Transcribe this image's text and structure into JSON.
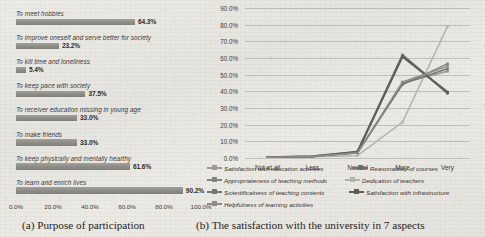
{
  "chart_data": [
    {
      "type": "bar",
      "orientation": "horizontal",
      "title": "Purpose of participation",
      "panel_label": "(a)",
      "xlabel": "",
      "ylabel": "",
      "xlim": [
        0,
        100
      ],
      "xticks": [
        "0.0%",
        "20.0%",
        "40.0%",
        "60.0%",
        "80.0%",
        "100.0%"
      ],
      "xtick_values": [
        0,
        20,
        40,
        60,
        80,
        100
      ],
      "grid": false,
      "categories": [
        "To meet hobbies",
        "To improve oneself and serve better for society",
        "To kill time and loneliness",
        "To keep pace with  society",
        "To receiver education missing in young age",
        "To make friends",
        "To keep physically and mentally hearthy",
        "To learn and enrich lives"
      ],
      "values": [
        64.3,
        23.2,
        5.4,
        37.5,
        33.0,
        33.0,
        61.6,
        90.2
      ],
      "value_labels": [
        "64.3%",
        "23.2%",
        "5.4%",
        "37.5%",
        "33.0%",
        "33.0%",
        "61.6%",
        "90.2%"
      ],
      "bar_color": "#8d8b86"
    },
    {
      "type": "line",
      "title": "The satisfaction with the university in 7 aspects",
      "panel_label": "(b)",
      "xlabel": "",
      "ylabel": "",
      "ylim": [
        0,
        90
      ],
      "yticks": [
        "0.0%",
        "10.0%",
        "20.0%",
        "30.0%",
        "40.0%",
        "50.0%",
        "60.0%",
        "70.0%",
        "80.0%",
        "90.0%"
      ],
      "ytick_values": [
        0,
        10,
        20,
        30,
        40,
        50,
        60,
        70,
        80,
        90
      ],
      "categories": [
        "Not at all",
        "Less",
        "Neutral",
        "More",
        "Very"
      ],
      "grid": true,
      "legend_position": "bottom",
      "series": [
        {
          "name": "Satisfaction with education activities",
          "values": [
            0.4,
            0.9,
            3.0,
            45.0,
            52.0
          ],
          "color": "#9b9994"
        },
        {
          "name": "Reasonability of courses",
          "values": [
            0.4,
            0.9,
            3.6,
            61.8,
            38.8
          ],
          "color": "#6e6c67"
        },
        {
          "name": "Appropriateness of teaching methods",
          "values": [
            0.4,
            0.9,
            3.2,
            44.0,
            56.5
          ],
          "color": "#84827d"
        },
        {
          "name": "Dedication of teachers",
          "values": [
            0.3,
            0.7,
            1.4,
            21.5,
            79.0
          ],
          "color": "#b5b3ae"
        },
        {
          "name": "Scientificalness of teaching contents",
          "values": [
            0.4,
            0.9,
            3.3,
            44.6,
            53.5
          ],
          "color": "#77756f"
        },
        {
          "name": "Satisfaction with infrastructure",
          "values": [
            0.5,
            1.0,
            3.8,
            60.8,
            39.6
          ],
          "color": "#5f5d58"
        },
        {
          "name": "Helpfulness of learning activities",
          "values": [
            0.4,
            0.9,
            3.1,
            45.6,
            55.0
          ],
          "color": "#8e8c87"
        }
      ]
    }
  ],
  "panel_a": {
    "caption_label": "(a)",
    "caption_text": "Purpose of participation"
  },
  "panel_b": {
    "caption_label": "(b)",
    "caption_text": "The satisfaction with the university in 7 aspects"
  }
}
